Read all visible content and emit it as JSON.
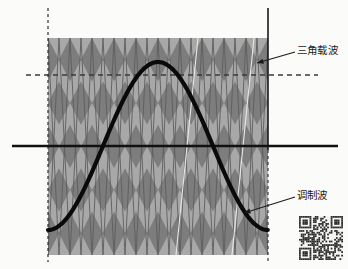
{
  "figure": {
    "background_color": "#fbfbfa",
    "annotations": [
      {
        "id": "carrier",
        "label": "三角载波",
        "meaning": "triangular-carrier-wave",
        "text_x": 297,
        "text_y": 45,
        "leader_from_x": 295,
        "leader_from_y": 52,
        "leader_to_x": 257,
        "leader_to_y": 63,
        "color": "#1b1b1b"
      },
      {
        "id": "modulation",
        "label": "调制波",
        "meaning": "modulation-wave",
        "text_x": 297,
        "text_y": 190,
        "leader_from_x": 295,
        "leader_from_y": 197,
        "leader_to_x": 244,
        "leader_to_y": 213,
        "color": "#1b1b1b"
      }
    ]
  },
  "chart_data": {
    "type": "line",
    "title": "",
    "xlabel": "",
    "ylabel": "",
    "grid": false,
    "legend_position": "annotations-right",
    "plot_area": {
      "left": 48,
      "right": 268,
      "top": 38,
      "bottom": 255,
      "zero_axis_y": 146
    },
    "axis_lines": [
      {
        "name": "zero-axis",
        "orientation": "horizontal",
        "value": 0,
        "y_px": 146,
        "x_start_px": 12,
        "x_end_px": 338,
        "style": "solid",
        "color": "#111111",
        "width_px": 2.6
      },
      {
        "name": "reference-level",
        "orientation": "horizontal",
        "value": 0.66,
        "y_px": 75,
        "x_start_px": 26,
        "x_end_px": 318,
        "style": "dashed",
        "color": "#3a3a3a",
        "width_px": 1.4
      },
      {
        "name": "period-start",
        "orientation": "vertical",
        "x_px": 48,
        "y_start_px": 8,
        "y_end_px": 262,
        "style": "dashed",
        "color": "#2d2d2d",
        "width_px": 1.2
      },
      {
        "name": "period-end",
        "orientation": "vertical",
        "x_px": 268,
        "y_start_px": 8,
        "y_end_px": 150,
        "style": "solid",
        "color": "#1a1a1a",
        "width_px": 1.6
      },
      {
        "name": "period-end-lower",
        "orientation": "vertical",
        "x_px": 268,
        "y_start_px": 150,
        "y_end_px": 262,
        "style": "dashed",
        "color": "#3a3a3a",
        "width_px": 1.2
      }
    ],
    "series": [
      {
        "name": "三角载波",
        "name_en": "triangular carrier",
        "type": "triangle",
        "amplitude": 1.0,
        "periods": 10,
        "period_px": 22,
        "peak_y_px": 38,
        "trough_y_px": 255,
        "phase": "peak-at-start",
        "fill_dark": "#7d7d7d",
        "fill_light": "#a8a8a8",
        "line_color": "#5d5d5d",
        "peaks_x_px": [
          48,
          70,
          92,
          114,
          136,
          158,
          180,
          202,
          224,
          246,
          268
        ],
        "troughs_x_px": [
          59,
          81,
          103,
          125,
          147,
          169,
          191,
          213,
          235,
          257
        ]
      },
      {
        "name": "调制波",
        "name_en": "modulation wave",
        "type": "sine",
        "amplitude": 0.78,
        "periods": 1,
        "color": "#0a0a0a",
        "width_px": 4.2,
        "start_x_px": 48,
        "end_x_px": 268,
        "zero_crossings_x_px": [
          103,
          213
        ],
        "peak_x_px": 158,
        "peak_y_px": 62,
        "start_y_px": 228,
        "end_y_px": 228
      }
    ]
  },
  "qr_code": {
    "name": "qr-code",
    "x": 299,
    "y": 216,
    "size": 44,
    "modules": 25,
    "foreground": "#2b2b2b",
    "background": "#f4f4f2"
  }
}
